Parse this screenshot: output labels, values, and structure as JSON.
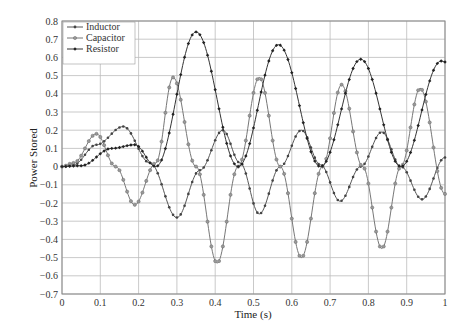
{
  "chart_data": {
    "type": "line",
    "title": "",
    "xlabel": "Time (s)",
    "ylabel": "Power Stored",
    "xlim": [
      0,
      1
    ],
    "ylim": [
      -0.7,
      0.8
    ],
    "xticks": [
      "0",
      "0.1",
      "0.2",
      "0.3",
      "0.4",
      "0.5",
      "0.6",
      "0.7",
      "0.8",
      "0.9",
      "1"
    ],
    "yticks": [
      "0.8",
      "0.7",
      "0.6",
      "0.5",
      "0.4",
      "0.3",
      "0.2",
      "0.1",
      "0",
      "-0.1",
      "-0.2",
      "-0.3",
      "-0.4",
      "-0.5",
      "-0.6",
      "-0.7"
    ],
    "grid": true,
    "legend_position": "upper-left",
    "series": [
      {
        "name": "Inductor",
        "color": "#555555",
        "marker": "dot",
        "keypoints": [
          [
            0,
            0
          ],
          [
            0.03,
            0.01
          ],
          [
            0.09,
            0.12
          ],
          [
            0.16,
            0.22
          ],
          [
            0.23,
            0.02
          ],
          [
            0.3,
            -0.28
          ],
          [
            0.36,
            -0.02
          ],
          [
            0.42,
            0.2
          ],
          [
            0.465,
            0.02
          ],
          [
            0.515,
            -0.26
          ],
          [
            0.57,
            0.0
          ],
          [
            0.625,
            0.2
          ],
          [
            0.675,
            0.01
          ],
          [
            0.726,
            -0.19
          ],
          [
            0.78,
            0.0
          ],
          [
            0.835,
            0.19
          ],
          [
            0.885,
            0.0
          ],
          [
            0.94,
            -0.18
          ],
          [
            1.0,
            0.05
          ]
        ]
      },
      {
        "name": "Capacitor",
        "color": "#777777",
        "marker": "circle",
        "keypoints": [
          [
            0,
            0
          ],
          [
            0.03,
            0.02
          ],
          [
            0.09,
            0.18
          ],
          [
            0.14,
            0.0
          ],
          [
            0.19,
            -0.21
          ],
          [
            0.245,
            0.02
          ],
          [
            0.29,
            0.49
          ],
          [
            0.35,
            0.0
          ],
          [
            0.405,
            -0.53
          ],
          [
            0.46,
            0.0
          ],
          [
            0.515,
            0.49
          ],
          [
            0.57,
            0.0
          ],
          [
            0.625,
            -0.5
          ],
          [
            0.68,
            0.0
          ],
          [
            0.73,
            0.45
          ],
          [
            0.785,
            0.0
          ],
          [
            0.835,
            -0.45
          ],
          [
            0.885,
            0.0
          ],
          [
            0.935,
            0.43
          ],
          [
            1.0,
            -0.15
          ]
        ]
      },
      {
        "name": "Resistor",
        "color": "#333333",
        "marker": "diamond",
        "keypoints": [
          [
            0,
            0
          ],
          [
            0.05,
            0.005
          ],
          [
            0.13,
            0.1
          ],
          [
            0.19,
            0.12
          ],
          [
            0.245,
            0.0
          ],
          [
            0.35,
            0.74
          ],
          [
            0.46,
            0.0
          ],
          [
            0.565,
            0.67
          ],
          [
            0.675,
            0.0
          ],
          [
            0.78,
            0.59
          ],
          [
            0.885,
            0.0
          ],
          [
            0.99,
            0.58
          ],
          [
            1.0,
            0.575
          ]
        ]
      }
    ]
  },
  "legend": {
    "items": [
      "Inductor",
      "Capacitor",
      "Resistor"
    ]
  }
}
